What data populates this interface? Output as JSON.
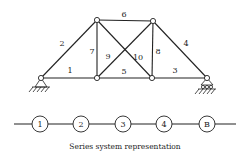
{
  "truss": {
    "nodes": {
      "A": [
        41,
        78
      ],
      "B": [
        97,
        78
      ],
      "C": [
        152,
        78
      ],
      "D": [
        207,
        78
      ],
      "E": [
        97,
        20
      ],
      "F": [
        153,
        21
      ]
    },
    "members": [
      {
        "id": "1",
        "label": "1",
        "from": "A",
        "to": "B",
        "lx": 70,
        "ly": 73
      },
      {
        "id": "2",
        "label": "2",
        "from": "A",
        "to": "E",
        "lx": 62,
        "ly": 46
      },
      {
        "id": "3",
        "label": "3",
        "from": "C",
        "to": "D",
        "lx": 175,
        "ly": 73
      },
      {
        "id": "4",
        "label": "4",
        "from": "F",
        "to": "D",
        "lx": 186,
        "ly": 46
      },
      {
        "id": "5",
        "label": "5",
        "from": "B",
        "to": "C",
        "lx": 124,
        "ly": 74
      },
      {
        "id": "6",
        "label": "6",
        "from": "E",
        "to": "F",
        "lx": 124,
        "ly": 17
      },
      {
        "id": "7",
        "label": "7",
        "from": "B",
        "to": "E",
        "lx": 92,
        "ly": 54
      },
      {
        "id": "8",
        "label": "8",
        "from": "C",
        "to": "F",
        "lx": 158,
        "ly": 54
      },
      {
        "id": "9",
        "label": "9",
        "from": "B",
        "to": "F",
        "lx": 108,
        "ly": 59
      },
      {
        "id": "10",
        "label": "10",
        "from": "E",
        "to": "C",
        "lx": 138,
        "ly": 60
      }
    ],
    "supports": {
      "left": {
        "type": "pin",
        "node": "A"
      },
      "right": {
        "type": "roller",
        "node": "D"
      }
    }
  },
  "series": {
    "line_y": 124,
    "x_start": 14,
    "x_end": 236,
    "elements": [
      {
        "label": "1",
        "x": 40
      },
      {
        "label": "2",
        "x": 81
      },
      {
        "label": "3",
        "x": 123
      },
      {
        "label": "4",
        "x": 164
      },
      {
        "label": "B",
        "x": 207
      }
    ]
  },
  "caption": "Series system representation"
}
